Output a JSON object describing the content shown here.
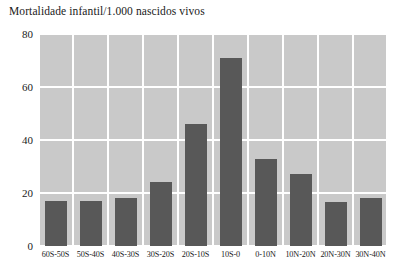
{
  "chart_data": {
    "type": "bar",
    "title": "Mortalidade infantil/1.000 nascidos vivos",
    "xlabel": "",
    "ylabel": "",
    "ylim": [
      0,
      80
    ],
    "yticks": [
      0,
      20,
      40,
      60,
      80
    ],
    "ytick_labels": [
      "0",
      "20",
      "40",
      "60",
      "80"
    ],
    "grid": true,
    "legend": "none",
    "plot_background": "#c9c9c9",
    "gridline_color": "#ffffff",
    "bar_color": "#585858",
    "categories": [
      "60S-50S",
      "50S-40S",
      "40S-30S",
      "30S-20S",
      "20S-10S",
      "10S-0",
      "0-10N",
      "10N-20N",
      "20N-30N",
      "30N-40N"
    ],
    "values": [
      17,
      17,
      18,
      24,
      46,
      71,
      33,
      27,
      16.5,
      18
    ]
  }
}
